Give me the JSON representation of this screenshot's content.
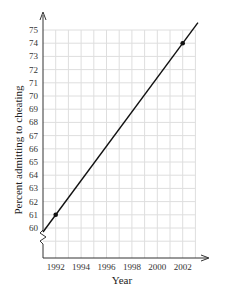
{
  "chart_data": {
    "type": "line",
    "title": "",
    "xlabel": "Year",
    "ylabel": "Percent admitting to cheating",
    "x_ticks": [
      "1992",
      "1994",
      "1996",
      "1998",
      "2000",
      "2002"
    ],
    "y_ticks": [
      "60",
      "61",
      "62",
      "63",
      "64",
      "65",
      "66",
      "67",
      "68",
      "69",
      "70",
      "71",
      "72",
      "73",
      "74",
      "75"
    ],
    "xlim": [
      1991,
      2003
    ],
    "ylim": [
      59,
      75
    ],
    "grid": true,
    "y_axis_break": true,
    "series": [
      {
        "name": "Percent admitting to cheating",
        "points": [
          {
            "x": 1992,
            "y": 61
          },
          {
            "x": 2002,
            "y": 74
          }
        ],
        "line_extends": true,
        "color": "#111111"
      }
    ]
  }
}
